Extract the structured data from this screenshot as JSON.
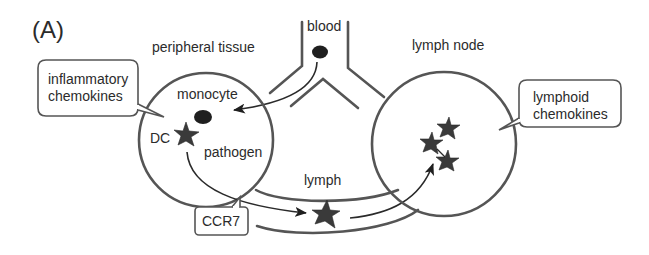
{
  "figure": {
    "panel_label": "(A)",
    "colors": {
      "background": "#ffffff",
      "outline": "#555555",
      "text": "#2b2b2b",
      "cell_fill": "#1f1f1f",
      "star_fill": "#3a3a3a"
    }
  },
  "regions": {
    "peripheral_tissue": "peripheral tissue",
    "blood": "blood",
    "lymph_node": "lymph node",
    "lymph": "lymph"
  },
  "cells": {
    "monocyte": "monocyte",
    "dc": "DC",
    "pathogen": "pathogen"
  },
  "callouts": {
    "inflammatory_line1": "inflammatory",
    "inflammatory_line2": "chemokines",
    "lymphoid_line1": "lymphoid",
    "lymphoid_line2": "chemokines",
    "receptor": "CCR7"
  },
  "icons": {
    "blood_cell": "filled-ellipse",
    "monocyte": "filled-ellipse",
    "dendritic_cell": "star",
    "migrating_dc": "star",
    "lymph_node_dcs": [
      "star",
      "star",
      "star"
    ]
  }
}
